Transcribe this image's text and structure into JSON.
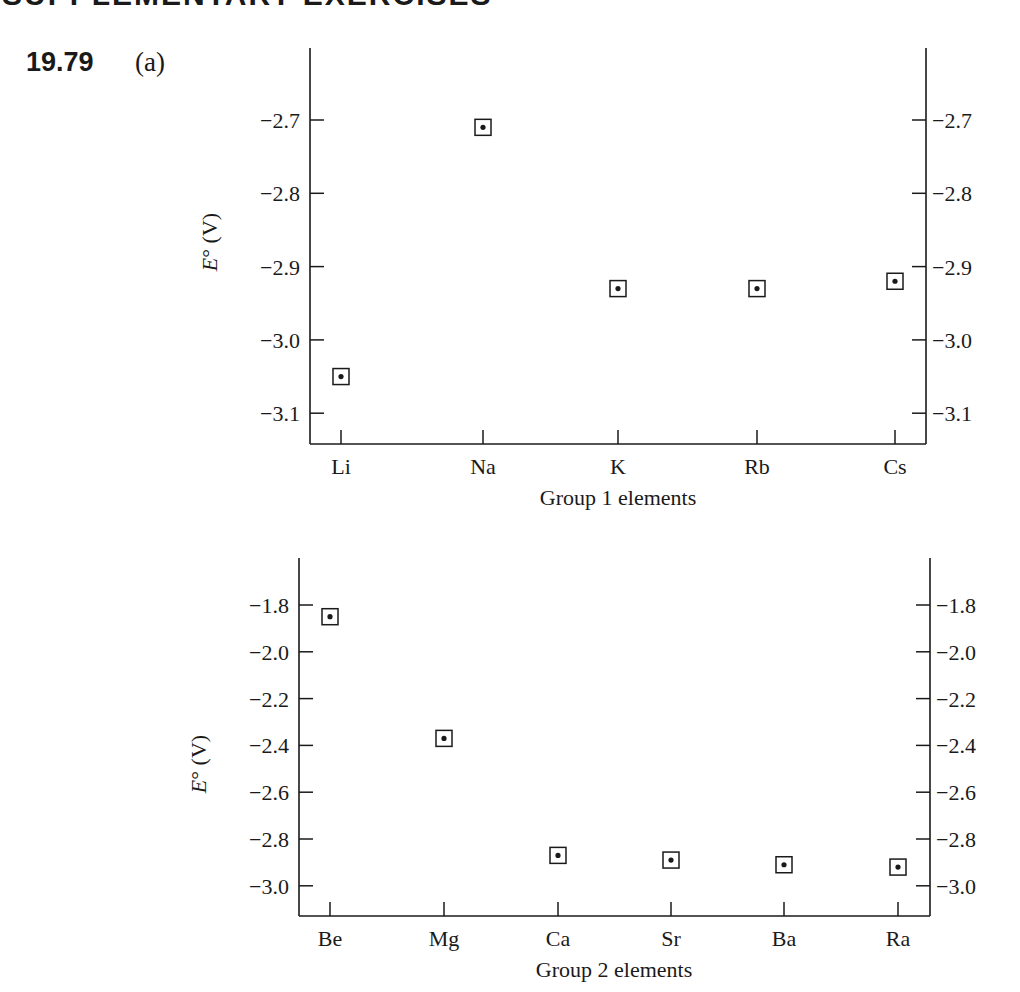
{
  "page": {
    "header": "SUPPLEMENTARY EXERCISES",
    "problem_number": "19.79",
    "part_label": "(a)"
  },
  "chart_data": [
    {
      "type": "scatter",
      "title": "",
      "xlabel": "Group 1 elements",
      "ylabel": "E° (V)",
      "categories": [
        "Li",
        "Na",
        "K",
        "Rb",
        "Cs"
      ],
      "values": [
        -3.05,
        -2.71,
        -2.93,
        -2.93,
        -2.92
      ],
      "ylim": [
        -3.14,
        -2.6
      ],
      "yticks": [
        -2.7,
        -2.8,
        -2.9,
        -3.0,
        -3.1
      ],
      "ytick_labels": [
        "−2.7",
        "−2.8",
        "−2.9",
        "−3.0",
        "−3.1"
      ],
      "grid": false,
      "right_axis_mirror": true,
      "marker": "boxed-dot",
      "legend": null
    },
    {
      "type": "scatter",
      "title": "",
      "xlabel": "Group 2 elements",
      "ylabel": "E° (V)",
      "categories": [
        "Be",
        "Mg",
        "Ca",
        "Sr",
        "Ba",
        "Ra"
      ],
      "values": [
        -1.85,
        -2.37,
        -2.87,
        -2.89,
        -2.91,
        -2.92
      ],
      "ylim": [
        -3.13,
        -1.6
      ],
      "yticks": [
        -1.8,
        -2.0,
        -2.2,
        -2.4,
        -2.6,
        -2.8,
        -3.0
      ],
      "ytick_labels": [
        "−1.8",
        "−2.0",
        "−2.2",
        "−2.4",
        "−2.6",
        "−2.8",
        "−3.0"
      ],
      "grid": false,
      "right_axis_mirror": true,
      "marker": "boxed-dot",
      "legend": null
    }
  ]
}
